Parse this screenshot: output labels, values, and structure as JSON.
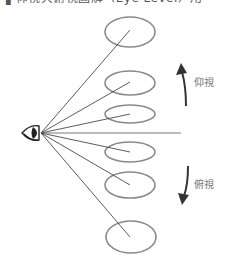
{
  "caption": {
    "text": "▌仰視與俯視圖解（Eye Level）用"
  },
  "diagram": {
    "eye": {
      "x": 41,
      "y": 133
    },
    "horizon_line": {
      "x1": 41,
      "y1": 133,
      "x2": 181,
      "y2": 133
    },
    "ellipses": [
      {
        "cx": 130,
        "cy": 32,
        "rx": 25,
        "ry": 15
      },
      {
        "cx": 130,
        "cy": 83,
        "rx": 25,
        "ry": 12
      },
      {
        "cx": 130,
        "cy": 114,
        "rx": 25,
        "ry": 9
      },
      {
        "cx": 130,
        "cy": 152,
        "rx": 25,
        "ry": 10
      },
      {
        "cx": 130,
        "cy": 185,
        "rx": 25,
        "ry": 13
      },
      {
        "cx": 131,
        "cy": 237,
        "rx": 25,
        "ry": 16
      }
    ],
    "sight_line_ends": [
      {
        "x": 130,
        "y": 30
      },
      {
        "x": 130,
        "y": 82
      },
      {
        "x": 130,
        "y": 114
      },
      {
        "x": 130,
        "y": 152
      },
      {
        "x": 130,
        "y": 185
      },
      {
        "x": 130,
        "y": 237
      }
    ],
    "colors": {
      "ellipse_stroke": "#8a8a8a",
      "line_stroke": "#4a4a4a",
      "arrow": "#333333",
      "eye": "#222222",
      "label": "#777777"
    }
  },
  "labels": {
    "looking_up": "仰視",
    "looking_down": "俯視"
  }
}
